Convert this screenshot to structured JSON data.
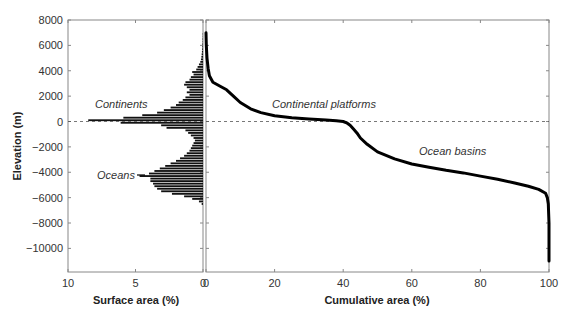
{
  "chart_data": [
    {
      "id": "histogram",
      "type": "bar",
      "orientation": "horizontal",
      "title": "",
      "xlabel": "Surface area (%)",
      "ylabel": "Elevation (m)",
      "xlim": [
        10,
        0
      ],
      "ylim": [
        -11900,
        8000
      ],
      "x_ticks": [
        10,
        5,
        0
      ],
      "y_ticks": [
        8000,
        6000,
        4000,
        2000,
        0,
        -2000,
        -4000,
        -6000,
        -8000,
        -10000
      ],
      "grid": false,
      "annotations": [
        {
          "text": "Continents",
          "x": 8,
          "y": 1200
        },
        {
          "text": "Oceans",
          "x": 6.5,
          "y": -4300
        }
      ],
      "bin_size_m": 200,
      "elevation": [
        6900,
        6700,
        6500,
        6300,
        6100,
        5900,
        5700,
        5500,
        5300,
        5100,
        4900,
        4700,
        4500,
        4300,
        4100,
        3900,
        3700,
        3500,
        3300,
        3100,
        2900,
        2700,
        2500,
        2300,
        2100,
        1900,
        1700,
        1500,
        1300,
        1100,
        900,
        700,
        500,
        300,
        100,
        -100,
        -300,
        -500,
        -700,
        -900,
        -1100,
        -1300,
        -1500,
        -1700,
        -1900,
        -2100,
        -2300,
        -2500,
        -2700,
        -2900,
        -3100,
        -3300,
        -3500,
        -3700,
        -3900,
        -4100,
        -4300,
        -4500,
        -4700,
        -4900,
        -5100,
        -5300,
        -5500,
        -5700,
        -5900,
        -6100,
        -6300,
        -6500
      ],
      "values": [
        0.02,
        0.02,
        0.03,
        0.03,
        0.04,
        0.05,
        0.06,
        0.08,
        0.1,
        0.12,
        0.15,
        0.2,
        0.3,
        0.4,
        0.5,
        0.8,
        0.7,
        0.9,
        1.0,
        1.3,
        1.4,
        1.2,
        1.0,
        1.2,
        1.0,
        1.3,
        1.5,
        1.8,
        2.0,
        2.4,
        2.9,
        3.4,
        4.5,
        5.9,
        8.5,
        6.1,
        3.1,
        2.7,
        1.3,
        1.1,
        0.9,
        0.7,
        0.6,
        0.7,
        0.8,
        0.9,
        1.0,
        1.2,
        1.4,
        1.7,
        2.0,
        2.4,
        2.8,
        3.2,
        3.6,
        4.0,
        4.7,
        3.9,
        3.9,
        3.7,
        3.6,
        3.4,
        3.1,
        2.3,
        1.4,
        0.8,
        0.3,
        0.1
      ]
    },
    {
      "id": "hypsometric-curve",
      "type": "line",
      "title": "",
      "xlabel": "Cumulative area (%)",
      "ylabel": "Elevation (m)",
      "xlim": [
        0,
        100
      ],
      "ylim": [
        -11900,
        8000
      ],
      "x_ticks": [
        0,
        20,
        40,
        60,
        80,
        100
      ],
      "y_ticks": [
        8000,
        6000,
        4000,
        2000,
        0,
        -2000,
        -4000,
        -6000,
        -8000,
        -10000
      ],
      "grid": false,
      "reference_line": {
        "y": 0,
        "style": "dashed"
      },
      "annotations": [
        {
          "text": "Continental platforms",
          "x": 28,
          "y": 1200
        },
        {
          "text": "Ocean basins",
          "x": 79,
          "y": -2300
        }
      ],
      "x": [
        0,
        0.1,
        0.3,
        0.6,
        1,
        2,
        4,
        6,
        8,
        10,
        13,
        16,
        20,
        25,
        30,
        35,
        38,
        40,
        41,
        42,
        43,
        44,
        45,
        47,
        50,
        55,
        60,
        65,
        70,
        75,
        80,
        85,
        90,
        94,
        97,
        99,
        99.5,
        99.8,
        100,
        100
      ],
      "y": [
        7000,
        6000,
        5000,
        4200,
        3600,
        3100,
        2800,
        2500,
        2000,
        1500,
        1000,
        700,
        450,
        300,
        200,
        120,
        60,
        0,
        -100,
        -300,
        -600,
        -900,
        -1300,
        -1800,
        -2400,
        -2950,
        -3350,
        -3600,
        -3850,
        -4050,
        -4300,
        -4550,
        -4850,
        -5100,
        -5350,
        -5650,
        -6000,
        -6500,
        -8000,
        -11000
      ]
    }
  ],
  "labels": {
    "y_axis_title": "Elevation (m)",
    "left_x_title": "Surface area (%)",
    "right_x_title": "Cumulative area (%)",
    "left_x_ticks": [
      "10",
      "5",
      "0"
    ],
    "right_x_ticks": [
      "0",
      "20",
      "40",
      "60",
      "80",
      "100"
    ],
    "y_ticks": [
      "8000",
      "6000",
      "4000",
      "2000",
      "0",
      "−2000",
      "−4000",
      "−6000",
      "−8000",
      "−10000"
    ],
    "annot_continents": "Continents",
    "annot_oceans": "Oceans",
    "annot_platforms": "Continental platforms",
    "annot_basins": "Ocean basins"
  },
  "colors": {
    "bars": "#111111",
    "curve": "#000000",
    "axis": "#888888",
    "dashed_line": "#555555"
  }
}
